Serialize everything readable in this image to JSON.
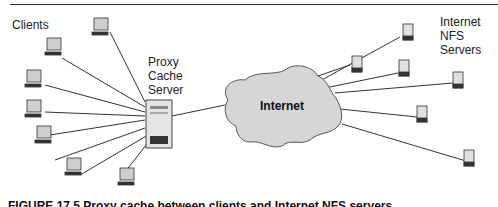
{
  "labels": {
    "clients": "Clients",
    "proxy": [
      "Proxy",
      "Cache",
      "Server"
    ],
    "internet": "Internet",
    "nfs": [
      "Internet",
      "NFS",
      "Servers"
    ]
  },
  "caption": "FIGURE 17.5 Proxy cache between clients and Internet NFS servers",
  "colors": {
    "cloud_fill": "#d6d6d6",
    "line": "#333333",
    "monitor_screen": "#c8c8c8"
  }
}
